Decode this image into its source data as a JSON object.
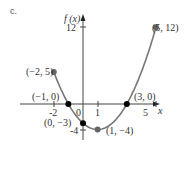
{
  "part_label": "c.",
  "chart_data": {
    "type": "line",
    "title": "",
    "xlabel": "x",
    "ylabel": "f (x)",
    "x_ticks": [
      "-2",
      "0",
      "1",
      "5"
    ],
    "y_ticks": [
      "12",
      "-4"
    ],
    "xlim": [
      -2,
      5
    ],
    "ylim": [
      -4,
      12
    ],
    "grid": false,
    "function": "f(x) = x^2 - 2x - 3, -2 <= x <= 5",
    "points": [
      {
        "x": -2,
        "y": 5,
        "label": "(−2, 5)"
      },
      {
        "x": -1,
        "y": 0,
        "label": "(−1, 0)"
      },
      {
        "x": 0,
        "y": -3,
        "label": "(0, −3)"
      },
      {
        "x": 1,
        "y": -4,
        "label": "(1, −4)"
      },
      {
        "x": 3,
        "y": 0,
        "label": "(3, 0)"
      },
      {
        "x": 5,
        "y": 12,
        "label": "(5, 12)"
      }
    ]
  }
}
